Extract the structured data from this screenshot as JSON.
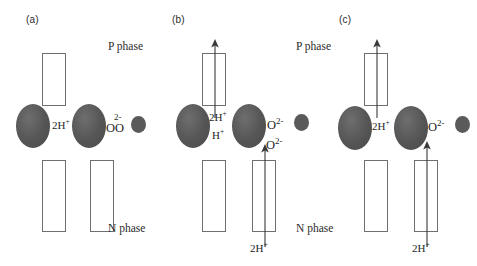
{
  "figure": {
    "caption_panels": [
      "(a)",
      "(b)",
      "(c)"
    ],
    "phase_top": "P phase",
    "phase_bottom": "N phase"
  },
  "panels": [
    {
      "id": "a",
      "label": "(a)",
      "phase_top": "P phase",
      "phase_bottom": "N phase",
      "labels": {
        "proton_left": "2H",
        "proton_left_charge": "+",
        "oxygen": "OO",
        "oxygen_charge": "2-"
      },
      "arrows": []
    },
    {
      "id": "b",
      "label": "(b)",
      "phase_top": "P phase",
      "phase_bottom": "N phase",
      "labels": {
        "proton_top": "2H",
        "proton_top_charge": "+",
        "proton_bottom": "H",
        "proton_bottom_charge": "+",
        "oxygen_upper": "O",
        "oxygen_upper_charge": "2-",
        "oxygen_lower": "O",
        "oxygen_lower_charge": "2-",
        "proton_influx": "2H",
        "proton_influx_charge": "+"
      },
      "arrows": [
        "up-through-top-left-rect",
        "up-through-bottom-right-rect"
      ]
    },
    {
      "id": "c",
      "label": "(c)",
      "phase_top": "P phase",
      "phase_bottom": "N phase",
      "labels": {
        "proton_mid": "2H",
        "proton_mid_charge": "+",
        "oxygen": "O",
        "oxygen_charge": "2-",
        "proton_influx": "2H",
        "proton_influx_charge": "+"
      },
      "arrows": [
        "up-through-top-left-rect",
        "up-through-bottom-right-rect"
      ]
    }
  ],
  "colors": {
    "ellipse_fill": "#595959",
    "dot_fill": "#5a5a5a",
    "rect_stroke": "#6f6f6f",
    "text": "#1f1f1f",
    "background": "#ffffff"
  }
}
